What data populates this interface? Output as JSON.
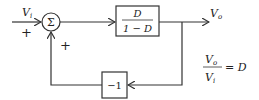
{
  "diagram": {
    "type": "block-diagram",
    "input": {
      "label": "V",
      "subscript": "i",
      "sign": "+"
    },
    "summer": {
      "symbol": "Σ",
      "feedback_sign": "+"
    },
    "forward_block": {
      "numerator": "D",
      "denominator": "1 − D"
    },
    "output": {
      "label": "V",
      "subscript": "o"
    },
    "feedback_block": {
      "label": "−1"
    },
    "equation": {
      "num_label": "V",
      "num_sub": "o",
      "den_label": "V",
      "den_sub": "i",
      "rhs": "= D"
    }
  },
  "colors": {
    "stroke": "#333333",
    "text": "#222222",
    "background": "#ffffff"
  }
}
